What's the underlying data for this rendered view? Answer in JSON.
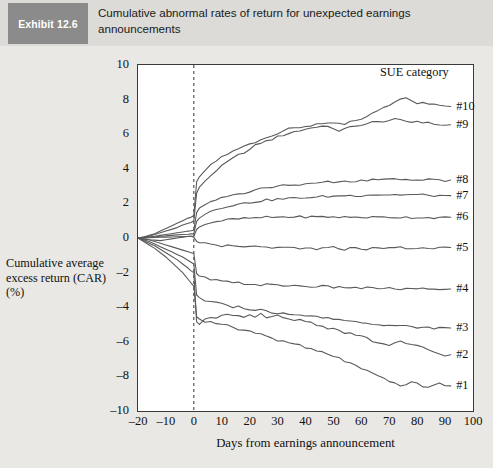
{
  "header": {
    "exhibit_tag": "Exhibit 12.6",
    "title": "Cumulative abnormal rates of return for unexpected earnings announcements"
  },
  "chart_data": {
    "type": "line",
    "title": "Cumulative abnormal rates of return for unexpected earnings announcements",
    "xlabel": "Days from earnings announcement",
    "ylabel": "Cumulative average excess return (CAR) (%)",
    "ylabel_lines": [
      "Cumulative average",
      "excess return (CAR)",
      "(%)"
    ],
    "legend_title": "SUE category",
    "legend_position": "right-inside",
    "grid": false,
    "xlim": [
      -20,
      100
    ],
    "ylim": [
      -10,
      10
    ],
    "xticks": [
      -20,
      -10,
      0,
      10,
      20,
      30,
      40,
      50,
      60,
      70,
      80,
      90,
      100
    ],
    "yticks": [
      10,
      8,
      6,
      4,
      2,
      0,
      -2,
      -4,
      -6,
      -8,
      -10
    ],
    "xtick_labels": [
      "–20",
      "–10",
      "0",
      "10",
      "20",
      "30",
      "40",
      "50",
      "60",
      "70",
      "80",
      "90",
      "100"
    ],
    "ytick_labels": [
      "10",
      "8",
      "6",
      "4",
      "2",
      "0",
      "–2",
      "–4",
      "–6",
      "–8",
      "–10"
    ],
    "annotations": [
      {
        "name": "event-day-line",
        "type": "vline",
        "x": 0,
        "style": "dashed"
      }
    ],
    "line_color": "#5a5a5a",
    "x": [
      -20,
      -18,
      -16,
      -14,
      -12,
      -10,
      -8,
      -6,
      -4,
      -2,
      -1,
      0,
      1,
      2,
      4,
      6,
      8,
      10,
      12,
      14,
      16,
      18,
      20,
      22,
      24,
      26,
      28,
      30,
      32,
      34,
      36,
      38,
      40,
      42,
      44,
      46,
      48,
      50,
      52,
      54,
      56,
      58,
      60,
      62,
      64,
      66,
      68,
      70,
      72,
      74,
      76,
      78,
      80,
      82,
      84,
      86,
      88,
      90
    ],
    "series": [
      {
        "name": "#10",
        "label": "#10",
        "label_y": 7.6,
        "values": [
          0.0,
          0.05,
          0.15,
          0.25,
          0.4,
          0.55,
          0.7,
          0.85,
          1.0,
          1.15,
          1.2,
          1.3,
          3.2,
          3.5,
          3.9,
          4.2,
          4.45,
          4.7,
          4.85,
          5.0,
          5.15,
          5.3,
          5.45,
          5.55,
          5.7,
          5.8,
          5.95,
          6.05,
          6.2,
          6.3,
          6.35,
          6.4,
          6.45,
          6.5,
          6.6,
          6.55,
          6.6,
          6.65,
          6.6,
          6.55,
          6.7,
          6.8,
          6.9,
          7.0,
          7.2,
          7.4,
          7.55,
          7.7,
          7.9,
          8.05,
          8.15,
          7.9,
          7.75,
          7.85,
          7.7,
          7.75,
          7.7,
          7.65
        ]
      },
      {
        "name": "#9",
        "label": "#9",
        "label_y": 6.55,
        "values": [
          0.0,
          0.05,
          0.1,
          0.2,
          0.3,
          0.4,
          0.5,
          0.6,
          0.75,
          0.85,
          0.9,
          1.0,
          2.6,
          2.9,
          3.3,
          3.6,
          3.9,
          4.15,
          4.4,
          4.6,
          4.8,
          4.95,
          5.1,
          5.35,
          5.5,
          5.6,
          5.7,
          5.85,
          5.95,
          6.05,
          6.15,
          6.2,
          6.3,
          6.35,
          6.45,
          6.45,
          6.4,
          6.35,
          6.2,
          6.3,
          6.4,
          6.45,
          6.55,
          6.6,
          6.7,
          6.7,
          6.75,
          6.8,
          6.85,
          6.8,
          6.75,
          6.7,
          6.75,
          6.7,
          6.65,
          6.6,
          6.55,
          6.5
        ]
      },
      {
        "name": "#8",
        "label": "#8",
        "label_y": 3.35,
        "values": [
          0.0,
          0.02,
          0.05,
          0.1,
          0.15,
          0.2,
          0.25,
          0.3,
          0.35,
          0.4,
          0.42,
          0.45,
          1.5,
          1.7,
          1.9,
          2.05,
          2.2,
          2.3,
          2.4,
          2.5,
          2.55,
          2.6,
          2.7,
          2.8,
          2.85,
          2.9,
          2.95,
          3.0,
          3.05,
          3.1,
          3.05,
          3.1,
          3.15,
          3.2,
          3.15,
          3.2,
          3.25,
          3.2,
          3.25,
          3.3,
          3.25,
          3.3,
          3.35,
          3.3,
          3.35,
          3.4,
          3.35,
          3.4,
          3.4,
          3.35,
          3.4,
          3.35,
          3.4,
          3.35,
          3.4,
          3.35,
          3.35,
          3.3
        ]
      },
      {
        "name": "#7",
        "label": "#7",
        "label_y": 2.45,
        "values": [
          0.0,
          0.02,
          0.04,
          0.06,
          0.1,
          0.12,
          0.15,
          0.18,
          0.2,
          0.22,
          0.24,
          0.25,
          1.0,
          1.2,
          1.4,
          1.55,
          1.65,
          1.75,
          1.85,
          1.9,
          1.95,
          2.0,
          2.05,
          2.1,
          2.15,
          2.2,
          2.2,
          2.25,
          2.25,
          2.3,
          2.3,
          2.3,
          2.35,
          2.35,
          2.35,
          2.4,
          2.4,
          2.4,
          2.45,
          2.45,
          2.45,
          2.45,
          2.45,
          2.5,
          2.5,
          2.5,
          2.5,
          2.5,
          2.5,
          2.5,
          2.5,
          2.5,
          2.5,
          2.5,
          2.45,
          2.45,
          2.45,
          2.45
        ]
      },
      {
        "name": "#6",
        "label": "#6",
        "label_y": 1.2,
        "values": [
          0.0,
          0.01,
          0.02,
          0.03,
          0.04,
          0.05,
          0.06,
          0.07,
          0.08,
          0.09,
          0.1,
          0.1,
          0.55,
          0.65,
          0.8,
          0.9,
          0.95,
          1.0,
          1.05,
          1.08,
          1.1,
          1.12,
          1.15,
          1.15,
          1.18,
          1.2,
          1.2,
          1.2,
          1.22,
          1.22,
          1.22,
          1.22,
          1.22,
          1.22,
          1.22,
          1.22,
          1.22,
          1.22,
          1.2,
          1.2,
          1.2,
          1.2,
          1.2,
          1.2,
          1.2,
          1.2,
          1.2,
          1.2,
          1.2,
          1.2,
          1.2,
          1.18,
          1.18,
          1.18,
          1.18,
          1.18,
          1.18,
          1.18
        ]
      },
      {
        "name": "#5",
        "label": "#5",
        "label_y": -0.55,
        "values": [
          0.0,
          -0.05,
          -0.1,
          -0.12,
          -0.15,
          -0.1,
          -0.05,
          0.0,
          0.05,
          0.1,
          0.1,
          0.05,
          -0.2,
          -0.25,
          -0.3,
          -0.35,
          -0.4,
          -0.45,
          -0.45,
          -0.5,
          -0.5,
          -0.55,
          -0.5,
          -0.5,
          -0.55,
          -0.5,
          -0.55,
          -0.6,
          -0.6,
          -0.55,
          -0.6,
          -0.65,
          -0.6,
          -0.6,
          -0.65,
          -0.6,
          -0.6,
          -0.55,
          -0.6,
          -0.65,
          -0.6,
          -0.55,
          -0.6,
          -0.65,
          -0.6,
          -0.6,
          -0.55,
          -0.55,
          -0.6,
          -0.55,
          -0.6,
          -0.65,
          -0.6,
          -0.55,
          -0.6,
          -0.6,
          -0.55,
          -0.55
        ]
      },
      {
        "name": "#4",
        "label": "#4",
        "label_y": -2.95,
        "values": [
          0.0,
          -0.05,
          -0.1,
          -0.2,
          -0.3,
          -0.4,
          -0.5,
          -0.6,
          -0.7,
          -0.8,
          -0.85,
          -0.9,
          -2.1,
          -2.2,
          -2.3,
          -2.4,
          -2.45,
          -2.5,
          -2.55,
          -2.6,
          -2.6,
          -2.65,
          -2.65,
          -2.7,
          -2.7,
          -2.7,
          -2.72,
          -2.75,
          -2.75,
          -2.75,
          -2.75,
          -2.78,
          -2.8,
          -2.8,
          -2.8,
          -2.8,
          -2.82,
          -2.85,
          -2.85,
          -2.85,
          -2.85,
          -2.88,
          -2.9,
          -2.9,
          -2.9,
          -2.9,
          -2.9,
          -2.92,
          -2.95,
          -2.95,
          -2.95,
          -2.95,
          -2.95,
          -2.95,
          -2.95,
          -2.95,
          -2.95,
          -2.95
        ]
      },
      {
        "name": "#3",
        "label": "#3",
        "label_y": -5.2,
        "values": [
          0.0,
          -0.1,
          -0.2,
          -0.35,
          -0.5,
          -0.65,
          -0.8,
          -0.95,
          -1.1,
          -1.3,
          -1.4,
          -1.5,
          -3.3,
          -3.5,
          -3.65,
          -3.7,
          -3.75,
          -3.8,
          -3.95,
          -4.0,
          -3.95,
          -4.05,
          -4.1,
          -4.2,
          -4.15,
          -4.25,
          -4.3,
          -4.35,
          -4.3,
          -4.35,
          -4.4,
          -4.45,
          -4.5,
          -4.5,
          -4.55,
          -4.6,
          -4.65,
          -4.65,
          -4.7,
          -4.75,
          -4.8,
          -4.85,
          -4.85,
          -4.9,
          -4.95,
          -4.95,
          -5.0,
          -5.05,
          -5.05,
          -5.1,
          -5.1,
          -5.15,
          -5.15,
          -5.2,
          -5.2,
          -5.2,
          -5.2,
          -5.2
        ]
      },
      {
        "name": "#2",
        "label": "#2",
        "label_y": -6.75,
        "values": [
          0.0,
          -0.15,
          -0.3,
          -0.45,
          -0.65,
          -0.85,
          -1.05,
          -1.25,
          -1.5,
          -1.75,
          -1.9,
          -2.0,
          -4.8,
          -4.95,
          -4.7,
          -4.6,
          -4.7,
          -4.5,
          -4.45,
          -4.55,
          -4.45,
          -4.6,
          -4.5,
          -4.6,
          -4.4,
          -4.55,
          -4.6,
          -4.5,
          -4.65,
          -4.7,
          -4.75,
          -4.7,
          -4.8,
          -4.9,
          -5.0,
          -5.1,
          -5.2,
          -5.25,
          -5.35,
          -5.45,
          -5.55,
          -5.6,
          -5.7,
          -5.8,
          -5.95,
          -6.05,
          -6.15,
          -6.2,
          -6.1,
          -6.0,
          -6.15,
          -6.2,
          -6.25,
          -6.3,
          -6.45,
          -6.6,
          -6.7,
          -6.75
        ]
      },
      {
        "name": "#1",
        "label": "#1",
        "label_y": -8.55,
        "values": [
          0.0,
          -0.2,
          -0.4,
          -0.6,
          -0.85,
          -1.1,
          -1.4,
          -1.7,
          -2.0,
          -2.4,
          -2.6,
          -2.8,
          -4.6,
          -4.75,
          -4.85,
          -4.8,
          -4.9,
          -4.95,
          -5.05,
          -5.1,
          -5.25,
          -5.35,
          -5.4,
          -5.5,
          -5.55,
          -5.65,
          -5.8,
          -5.9,
          -6.0,
          -6.05,
          -6.1,
          -6.2,
          -6.35,
          -6.45,
          -6.55,
          -6.6,
          -6.7,
          -6.85,
          -6.95,
          -7.1,
          -7.25,
          -7.4,
          -7.55,
          -7.7,
          -7.85,
          -8.0,
          -8.15,
          -8.3,
          -8.4,
          -8.5,
          -8.45,
          -8.35,
          -8.45,
          -8.55,
          -8.6,
          -8.5,
          -8.45,
          -8.55
        ]
      }
    ]
  }
}
